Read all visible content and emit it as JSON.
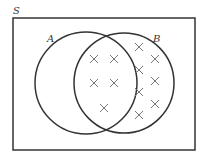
{
  "diagram": {
    "type": "venn",
    "universe_label": "S",
    "sets": [
      {
        "label": "A"
      },
      {
        "label": "B"
      }
    ],
    "regions": {
      "A_only": {
        "count": 0
      },
      "A_and_B": {
        "count": 5
      },
      "B_only": {
        "count": 7
      },
      "neither": {
        "count": 0
      }
    },
    "marker": "×",
    "colors": {
      "stroke": "#333333",
      "marker": "#777777"
    }
  }
}
